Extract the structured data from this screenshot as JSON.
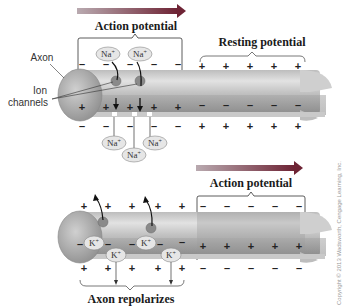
{
  "diagram": {
    "top_panel": {
      "direction_arrow": "arrow-right",
      "action_potential_label": "Action potential",
      "resting_potential_label": "Resting potential",
      "axon_label": "Axon",
      "ion_channels_label_line1": "Ion",
      "ion_channels_label_line2": "channels",
      "ions_outside_top": [
        "Na+",
        "Na+"
      ],
      "ions_below": [
        "Na+",
        "Na+",
        "Na+"
      ],
      "ion_symbol": "Na",
      "ion_charge": "+",
      "action_region_outside_signs": [
        "–",
        "–",
        "–",
        "–",
        "–"
      ],
      "action_region_inside_signs": [
        "+",
        "+",
        "+",
        "+",
        "+"
      ],
      "resting_region_outside_signs": [
        "+",
        "+",
        "+",
        "+",
        "+"
      ],
      "resting_region_inside_signs": [
        "–",
        "–",
        "–",
        "–",
        "–"
      ]
    },
    "bottom_panel": {
      "direction_arrow": "arrow-right",
      "action_potential_label": "Action potential",
      "repolarizes_label": "Axon repolarizes",
      "ion_symbol": "K",
      "ion_charge": "+",
      "ions_inside": [
        "K+",
        "K+"
      ],
      "ions_channel": [
        "K+",
        "K+"
      ],
      "repol_outside_signs": [
        "+",
        "+",
        "+",
        "+",
        "+"
      ],
      "repol_inside_signs": [
        "–",
        "–",
        "–",
        "–",
        "–"
      ],
      "action_outside_signs": [
        "–",
        "–",
        "–",
        "–",
        "–"
      ],
      "action_inside_signs": [
        "+",
        "+",
        "+",
        "+",
        "+"
      ]
    },
    "copyright": "Copyright © 2013 Wadsworth, Cengage Learning, Inc."
  },
  "colors": {
    "arrow": "#7a2a3a",
    "axon_light": "#d4d4d4",
    "axon_dark": "#9c9c9c",
    "ion_fill": "#e6e6e6"
  }
}
